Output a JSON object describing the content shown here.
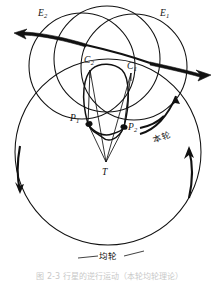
{
  "figure": {
    "caption": "图 2-3   行星的逆行运动（本轮均轮理论）",
    "ink_color": "#111111",
    "background": "#ffffff"
  },
  "labels": {
    "earth": "T",
    "epicycle_center_1": {
      "base": "C",
      "sub": "1"
    },
    "epicycle_center_2": {
      "base": "C",
      "sub": "2"
    },
    "planet_1": {
      "base": "P",
      "sub": "1"
    },
    "planet_2": {
      "base": "P",
      "sub": "2"
    },
    "epicycle_1": {
      "base": "E",
      "sub": "1"
    },
    "epicycle_2": {
      "base": "E",
      "sub": "2"
    },
    "epicycle_cn": "本轮",
    "deferent_cn": "均轮"
  },
  "geometry": {
    "deferent": {
      "cx": 108,
      "cy": 152,
      "r": 93,
      "name": "deferent-circle"
    },
    "epicycle_1": {
      "cx": 133,
      "cy": 68,
      "r": 52,
      "name": "epicycle-1-circle"
    },
    "epicycle_2": {
      "cx": 84,
      "cy": 66,
      "r": 52,
      "name": "epicycle-2-circle"
    },
    "epicycle_mid": {
      "cx": 108,
      "cy": 62,
      "r": 52,
      "name": "epicycle-mid-circle"
    },
    "points": {
      "T": {
        "x": 106,
        "y": 162
      },
      "C1": {
        "x": 130,
        "y": 72
      },
      "C2": {
        "x": 90,
        "y": 70
      },
      "P1": {
        "x": 88,
        "y": 124
      },
      "P2": {
        "x": 124,
        "y": 127
      }
    },
    "retrograde_loop": "lens-shaped cusp between P1 and P2"
  },
  "arrows": {
    "deferent_left": {
      "name": "deferent-left-arrow",
      "direction": "down"
    },
    "deferent_right": {
      "name": "deferent-right-arrow",
      "direction": "up"
    },
    "epicycle_left": {
      "name": "epicycle-left-arrow",
      "direction": "left"
    },
    "epicycle_right": {
      "name": "epicycle-right-arrow",
      "direction": "right"
    },
    "epicycle_inner": {
      "name": "epicycle-inner-arrow",
      "direction": "up-right"
    },
    "epicycle_lower": {
      "name": "epicycle-lower-arrow",
      "direction": "right"
    }
  }
}
